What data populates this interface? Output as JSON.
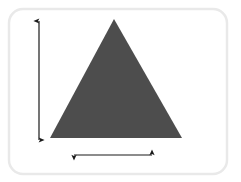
{
  "figure": {
    "name": "triangle-with-dimension-arrows",
    "canvas": {
      "width": 241,
      "height": 182,
      "background_color": "#ffffff"
    },
    "card": {
      "name": "rounded-card-frame",
      "x": 9,
      "y": 9,
      "width": 218,
      "height": 165,
      "corner_radius": 14,
      "fill_color": "#ffffff",
      "border_color": "#e9e9e9",
      "border_width": 2.5
    },
    "shape": {
      "name": "triangle",
      "type": "isosceles-triangle",
      "fill_color": "#4d4d4d",
      "apex": {
        "x": 114,
        "y": 19
      },
      "base_left": {
        "x": 50,
        "y": 138
      },
      "base_right": {
        "x": 182,
        "y": 138
      },
      "base_length_px": 132,
      "height_px": 119
    },
    "annotations": [
      {
        "name": "height-arrow",
        "orientation": "vertical",
        "double_headed": true,
        "color": "#1a1a1a",
        "line_width": 1.2,
        "x": 39,
        "y_start": 21,
        "y_end": 140,
        "measures": "height",
        "label": ""
      },
      {
        "name": "base-arrow",
        "orientation": "horizontal",
        "double_headed": true,
        "color": "#1a1a1a",
        "line_width": 1.2,
        "y": 155,
        "x_start": 74,
        "x_end": 152,
        "measures": "base",
        "label": ""
      }
    ],
    "alt_text": "A dark gray isosceles triangle inside a white rounded card, with a vertical double-headed arrow at the left indicating its height and a horizontal double-headed arrow below indicating its base."
  }
}
